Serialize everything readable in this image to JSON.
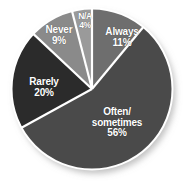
{
  "chart_data": {
    "type": "pie",
    "title": "",
    "categories": [
      "Always",
      "Often/ sometimes",
      "Rarely",
      "Never",
      "N/A"
    ],
    "values": [
      11,
      56,
      20,
      9,
      4
    ],
    "value_labels": [
      "11%",
      "56%",
      "20%",
      "9%",
      "4%"
    ],
    "unit": "%",
    "start_angle_deg": 0,
    "direction": "clockwise",
    "legend": "none",
    "grid": false,
    "slices": [
      {
        "label": "Always",
        "label_lines": [
          "Always"
        ],
        "value": 11,
        "value_label": "11%",
        "color": "#6e6e6e",
        "start_deg": 0,
        "end_deg": 39.6
      },
      {
        "label": "Often/ sometimes",
        "label_lines": [
          "Often/",
          "sometimes"
        ],
        "value": 56,
        "value_label": "56%",
        "color": "#4a4a4a",
        "start_deg": 39.6,
        "end_deg": 241.2
      },
      {
        "label": "Rarely",
        "label_lines": [
          "Rarely"
        ],
        "value": 20,
        "value_label": "20%",
        "color": "#2b2b2b",
        "start_deg": 241.2,
        "end_deg": 313.2
      },
      {
        "label": "Never",
        "label_lines": [
          "Never"
        ],
        "value": 9,
        "value_label": "9%",
        "color": "#8a8a8a",
        "start_deg": 313.2,
        "end_deg": 345.6
      },
      {
        "label": "N/A",
        "label_lines": [
          "N/A"
        ],
        "value": 4,
        "value_label": "4%",
        "color": "#9a9a9a",
        "start_deg": 345.6,
        "end_deg": 360
      }
    ]
  },
  "style": {
    "background": "#ffffff",
    "separator_color": "#ffffff",
    "label_color": "#ffffff",
    "shadow_color": "#b4b4b4"
  }
}
